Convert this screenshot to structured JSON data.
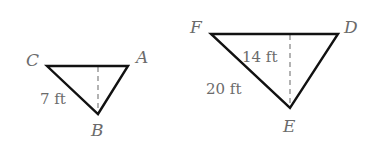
{
  "diagram": {
    "colors": {
      "stroke": "#111111",
      "label": "#6b6b6b",
      "altitude": "#8a8a8a",
      "background": "#ffffff"
    },
    "triangles": [
      {
        "name": "small",
        "vertices": [
          {
            "label": "C",
            "x": 47,
            "y": 66
          },
          {
            "label": "A",
            "x": 128,
            "y": 66
          },
          {
            "label": "B",
            "x": 98,
            "y": 114
          }
        ],
        "altitude": {
          "x": 98,
          "y1": 66,
          "y2": 114,
          "style": "dashed"
        },
        "measurements": [
          {
            "label": "7 ft",
            "refers_to": "side CB"
          }
        ]
      },
      {
        "name": "large",
        "vertices": [
          {
            "label": "F",
            "x": 211,
            "y": 34
          },
          {
            "label": "D",
            "x": 338,
            "y": 34
          },
          {
            "label": "E",
            "x": 290,
            "y": 108
          }
        ],
        "altitude": {
          "x": 290,
          "y1": 34,
          "y2": 108,
          "style": "dashed"
        },
        "measurements": [
          {
            "label": "14 ft",
            "refers_to": "altitude from E"
          },
          {
            "label": "20 ft",
            "refers_to": "side FE"
          }
        ]
      }
    ]
  }
}
